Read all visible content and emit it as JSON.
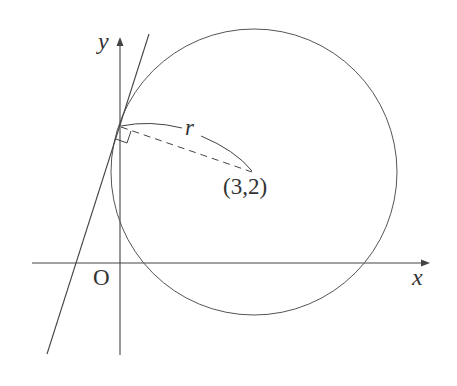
{
  "diagram": {
    "type": "coordinate-geometry",
    "labels": {
      "y_axis": "y",
      "x_axis": "x",
      "origin": "O",
      "center": "(3,2)",
      "radius": "r"
    },
    "colors": {
      "stroke": "#444444",
      "background": "#ffffff"
    }
  }
}
